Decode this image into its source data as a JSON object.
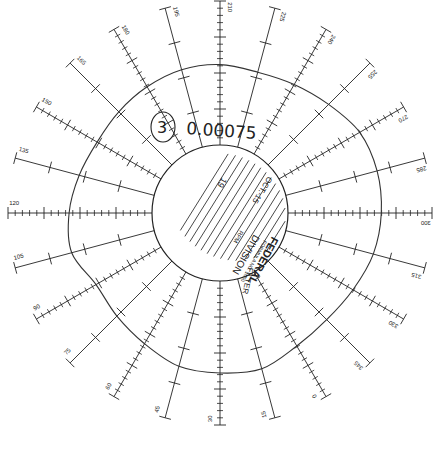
{
  "chart_data": {
    "type": "polar",
    "angle_unit": "degrees",
    "angular_labels": [
      "210",
      "225",
      "240",
      "255",
      "270",
      "285",
      "300",
      "315",
      "330",
      "345",
      "0",
      "15",
      "30",
      "45",
      "60",
      "75",
      "90",
      "105",
      "120",
      "135",
      "150",
      "165",
      "180",
      "195"
    ],
    "angular_labels_clockwise_from_top": true,
    "radial_axis": {
      "minor_ticks_per_axis": 10,
      "major_ticks_every": 5
    },
    "series": [
      {
        "name": "recorded trace",
        "angles_deg_from_top_clockwise": [
          0,
          15,
          30,
          45,
          60,
          75,
          90,
          105,
          120,
          135,
          150,
          165,
          180,
          195,
          210,
          225,
          240,
          255,
          270,
          285,
          300,
          315,
          330,
          345
        ],
        "radius_relative": [
          0.62,
          0.6,
          0.62,
          0.66,
          0.72,
          0.73,
          0.72,
          0.7,
          0.66,
          0.64,
          0.66,
          0.72,
          0.71,
          0.7,
          0.64,
          0.6,
          0.58,
          0.66,
          0.64,
          0.6,
          0.57,
          0.58,
          0.6,
          0.62
        ]
      }
    ]
  },
  "annotation": {
    "circled_number": "3",
    "handwritten_value": "0.00075"
  },
  "disk": {
    "brand": "FEDERAL",
    "formula_line": "FORMULA NO. 1000",
    "division_line": "DIVISION",
    "rpm_label": "RPM",
    "filter_label": "FILTER",
    "number": "19",
    "date": "OCT.-15"
  }
}
